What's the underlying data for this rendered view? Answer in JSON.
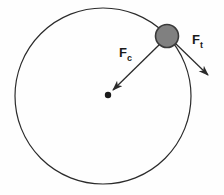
{
  "figure": {
    "background_color": "#fefefe",
    "stroke_color": "#2b2b2b",
    "ball_fill_color": "#808080",
    "ball_stroke_color": "#3a3a3a",
    "label_color": "#1a1a1a"
  },
  "circle_path": {
    "name": "circular-orbit-path",
    "center_x": 103,
    "center_y": 96,
    "radius": 88,
    "stroke_width": 1.2
  },
  "center_marker": {
    "name": "orbit-center-point",
    "x": 108,
    "y": 95,
    "radius": 3.2
  },
  "ball": {
    "name": "orbiting-ball",
    "x": 167,
    "y": 36,
    "radius": 11.5
  },
  "vectors": [
    {
      "id": "centripetal",
      "label_main": "F",
      "label_sub": "c",
      "label_x": 119,
      "label_y": 57,
      "start_x": 160,
      "start_y": 44,
      "end_x": 110,
      "end_y": 93,
      "stroke_width": 1.3
    },
    {
      "id": "tangential",
      "label_main": "F",
      "label_sub": "t",
      "label_x": 192,
      "label_y": 44,
      "start_x": 175,
      "start_y": 43,
      "end_x": 212,
      "end_y": 79,
      "stroke_width": 1.3
    }
  ]
}
